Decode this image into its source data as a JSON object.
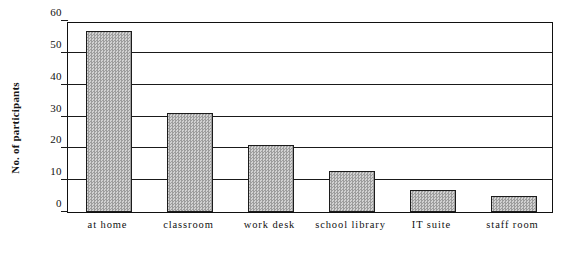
{
  "chart_data": {
    "type": "bar",
    "title": "",
    "subtitle": "",
    "xlabel": "",
    "ylabel": "No. of participants",
    "categories": [
      "at home",
      "classroom",
      "work desk",
      "school library",
      "IT suite",
      "staff room"
    ],
    "values": [
      57,
      31,
      21,
      13,
      7,
      5
    ],
    "ylim": [
      0,
      60
    ],
    "ytick_labels": [
      "0",
      "10",
      "20",
      "30",
      "40",
      "50",
      "60"
    ],
    "ytick_values": [
      0,
      10,
      20,
      30,
      40,
      50,
      60
    ],
    "grid": true,
    "grid_axis": "y",
    "legend": false,
    "legend_position": "none",
    "series": [
      {
        "name": "No. of participants",
        "values": [
          57,
          31,
          21,
          13,
          7,
          5
        ]
      }
    ],
    "colors": {
      "bar_fill": "#b4b4b4",
      "bar_border": "#1c1c1c",
      "axis": "#111111",
      "gridline": "#1a1a1a",
      "background": "#ffffff",
      "text": "#111111"
    }
  }
}
